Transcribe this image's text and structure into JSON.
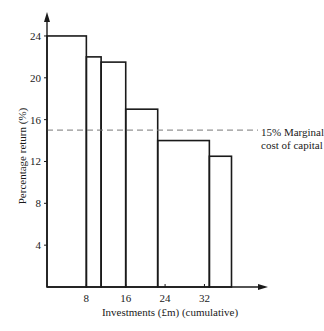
{
  "chart_data": {
    "type": "bar",
    "subtype": "step / variable-width bars (investment opportunity schedule)",
    "title": "",
    "xlabel": "Investments (£m) (cumulative)",
    "ylabel": "Percentage return (%)",
    "xlim": [
      0,
      40
    ],
    "ylim": [
      0,
      26
    ],
    "x_ticks": [
      8,
      16,
      24,
      32
    ],
    "y_ticks": [
      4,
      8,
      12,
      16,
      20,
      24
    ],
    "grid": false,
    "bars": [
      {
        "x_start": 0,
        "x_end": 8,
        "value": 24
      },
      {
        "x_start": 8,
        "x_end": 11,
        "value": 22
      },
      {
        "x_start": 11,
        "x_end": 16,
        "value": 21.5
      },
      {
        "x_start": 16,
        "x_end": 22.5,
        "value": 17
      },
      {
        "x_start": 22.5,
        "x_end": 33,
        "value": 14
      },
      {
        "x_start": 33,
        "x_end": 37.5,
        "value": 12.5
      }
    ],
    "reference_line": {
      "y": 15,
      "style": "dashed",
      "label": "15% Marginal cost of capital"
    },
    "annotations": [
      "15% Marginal",
      "cost of capital"
    ]
  },
  "labels": {
    "ylabel": "Percentage return (%)",
    "xlabel": "Investments (£m) (cumulative)",
    "annot_line1": "15% Marginal",
    "annot_line2": "cost of capital"
  }
}
